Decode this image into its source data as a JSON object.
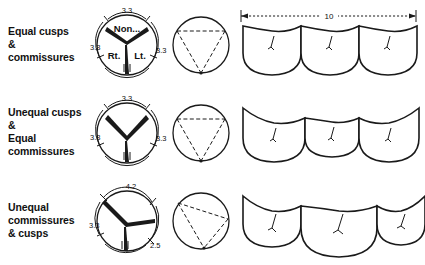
{
  "figure": {
    "background_color": "#ffffff",
    "ink_color": "#1a1a1a"
  },
  "rows": [
    {
      "id": "equal-cusps-commissures",
      "label_lines": [
        "Equal  cusps",
        "&",
        "commissures"
      ],
      "cross_section": {
        "sector_labels": {
          "top": "Non...",
          "left": "Rt.",
          "right": "Lt."
        },
        "arc_dimensions": {
          "top": "3.3",
          "left": "3.3",
          "right": "3.3"
        },
        "junction_offset_y": 0,
        "cusp_angles": [
          90,
          210,
          330
        ]
      },
      "triangle": {
        "symmetry": "isosceles",
        "apex": "bottom"
      },
      "cusps": {
        "widths": [
          64,
          64,
          64
        ],
        "depths": [
          40,
          40,
          40
        ],
        "dimension": {
          "value": "10",
          "show": true
        }
      }
    },
    {
      "id": "unequal-cusps-equal-commissures",
      "label_lines": [
        "Unequal  cusps",
        "&",
        "Equal",
        "commissures"
      ],
      "cross_section": {
        "sector_labels": {
          "top": "",
          "left": "",
          "right": ""
        },
        "arc_dimensions": {
          "top": "3.3",
          "left": "3.3",
          "right": "3.3"
        },
        "junction_offset_y": 8,
        "cusp_angles": [
          90,
          210,
          330
        ]
      },
      "triangle": {
        "symmetry": "isosceles",
        "apex": "bottom"
      },
      "cusps": {
        "widths": [
          66,
          60,
          66
        ],
        "depths": [
          42,
          32,
          42
        ],
        "dimension": {
          "value": "",
          "show": false
        }
      }
    },
    {
      "id": "unequal-commissures-and-cusps",
      "label_lines": [
        "Unequal",
        "commissures",
        "& cusps"
      ],
      "cross_section": {
        "sector_labels": {
          "top": "",
          "left": "",
          "right": ""
        },
        "arc_dimensions": {
          "top": "4.2",
          "left": "3.3",
          "right": "2.5"
        },
        "junction_offset_y": 6,
        "cusp_angles": [
          115,
          215,
          350
        ]
      },
      "triangle": {
        "symmetry": "scalene",
        "apex": "bottom"
      },
      "cusps": {
        "widths": [
          58,
          76,
          52
        ],
        "depths": [
          38,
          50,
          32
        ],
        "dimension": {
          "value": "",
          "show": false
        }
      }
    }
  ]
}
